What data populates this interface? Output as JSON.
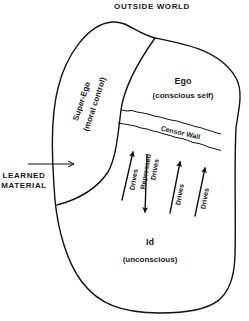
{
  "diagram": {
    "title": "OUTSIDE WORLD",
    "external_input": {
      "line1": "LEARNED",
      "line2": "MATERIAL"
    },
    "regions": {
      "super_ego": {
        "name": "Super-Ego",
        "description": "(moral control)"
      },
      "ego": {
        "name": "Ego",
        "description": "(conscious self)"
      },
      "censor_wall": {
        "name": "Censor Wall"
      },
      "id": {
        "name": "Id",
        "description": "(unconscious)"
      }
    },
    "arrows": [
      {
        "label": "Drives",
        "direction": "up"
      },
      {
        "label_line1": "Repressed",
        "label_line2": "Drives",
        "direction": "down"
      },
      {
        "label": "Drives",
        "direction": "up"
      },
      {
        "label": "Drives",
        "direction": "up"
      }
    ],
    "colors": {
      "ink": "#111111",
      "background": "#ffffff"
    }
  }
}
